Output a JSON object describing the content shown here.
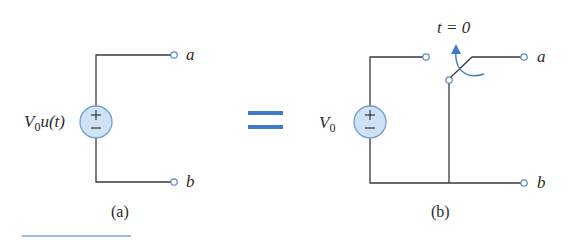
{
  "figure": {
    "left": {
      "source_label_var": "V",
      "source_label_sub": "0",
      "source_label_rest": "u(t)",
      "terminal_a": "a",
      "terminal_b": "b",
      "caption": "(a)",
      "source_symbol_plus": "+",
      "source_symbol_minus": "−"
    },
    "equals_symbol": "=",
    "right": {
      "source_label_var": "V",
      "source_label_sub": "0",
      "switch_label": "t = 0",
      "terminal_a": "a",
      "terminal_b": "b",
      "caption": "(b)",
      "source_symbol_plus": "+",
      "source_symbol_minus": "−"
    },
    "colors": {
      "wire": "#3a3a3a",
      "accent": "#3d7cc9",
      "source_fill": "#cfe2f5",
      "source_stroke": "#6f9fd0",
      "terminal_stroke": "#5a86c0"
    }
  }
}
